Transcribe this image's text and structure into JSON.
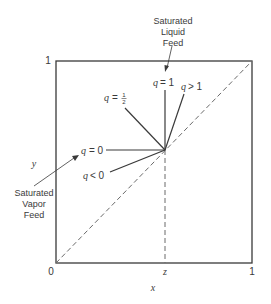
{
  "diagram": {
    "axes": {
      "x_label": "x",
      "y_label": "y",
      "x_ticks": [
        "0",
        "z",
        "1"
      ],
      "y_ticks": [
        "1"
      ]
    },
    "q_lines": [
      {
        "label_q": "q",
        "label_rel": "= 1",
        "id": "q-equals-1"
      },
      {
        "label_q": "q",
        "label_rel": "> 1",
        "id": "q-greater-1"
      },
      {
        "label_q": "q",
        "label_rel": "=",
        "frac_num": "1",
        "frac_den": "2",
        "id": "q-equals-half"
      },
      {
        "label_q": "q",
        "label_rel": "= 0",
        "id": "q-equals-0"
      },
      {
        "label_q": "q",
        "label_rel": "< 0",
        "id": "q-less-0"
      }
    ],
    "annotations": {
      "liquid_feed": [
        "Saturated",
        "Liquid",
        "Feed"
      ],
      "vapor_feed": [
        "Saturated",
        "Vapor",
        "Feed"
      ]
    },
    "colors": {
      "line": "#3a3a3a",
      "dashed": "#6a6a6a"
    }
  }
}
